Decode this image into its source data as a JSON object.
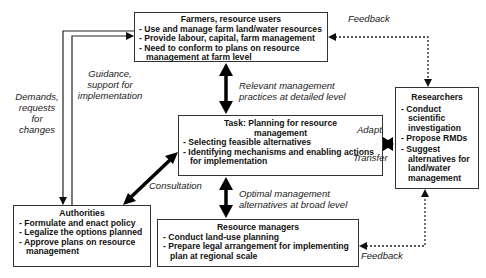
{
  "diagram": {
    "boxes": {
      "farmers": {
        "title": "Farmers, resource users",
        "items": [
          "Use and manage farm land/water resources",
          "Provide labour, capital, farm management",
          "Need to conform to plans on resource management at farm level"
        ]
      },
      "task": {
        "title": "Task: Planning for resource management",
        "items": [
          "Selecting feasible alternatives",
          "Identifying mechanisms and enabling actions for implementation"
        ]
      },
      "researchers": {
        "title": "Researchers",
        "items": [
          "Conduct scientific investigation",
          "Propose RMDs",
          "Suggest alternatives for land/water management"
        ]
      },
      "authorities": {
        "title": "Authorities",
        "items": [
          "Formulate and enact policy",
          "Legalize the options planned",
          "Approve plans on resource management"
        ]
      },
      "resource_managers": {
        "title": "Resource managers",
        "items": [
          "Conduct land-use planning",
          "Prepare legal arrangement for implementing plan at regional scale"
        ]
      }
    },
    "labels": {
      "feedback_top": "Feedback",
      "feedback_bottom": "Feedback",
      "relevant": "Relevant management practices at detailed level",
      "optimal": "Optimal management alternatives at broad level",
      "guidance": "Guidance, support for implementation",
      "demands": "Demands, requests for changes",
      "consultation": "Consultation",
      "adapt": "Adapt",
      "transfer": "Transfer"
    }
  }
}
